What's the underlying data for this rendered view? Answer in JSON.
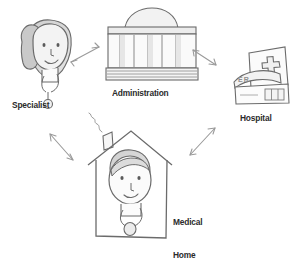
{
  "diagram": {
    "style": "hand-drawn pencil sketch",
    "background_color": "#ffffff",
    "ink_color": "#555555",
    "label_color": "#2b2b2b",
    "shade_color": "#d9d9d9",
    "nodes": [
      {
        "id": "specialist",
        "label": "Specialist",
        "icon": "doctor-with-stethoscope-icon",
        "description": "Person with long hair wearing a stethoscope",
        "position": "top-left"
      },
      {
        "id": "administration",
        "label": "Administration",
        "icon": "government-building-icon",
        "description": "Classical domed building with columns and steps",
        "position": "top-center"
      },
      {
        "id": "hospital",
        "label": "Hospital",
        "icon": "hospital-building-icon",
        "description": "Building with medical cross and ER sign",
        "sign_text": "ER",
        "position": "right"
      },
      {
        "id": "medical-home",
        "label_line1": "Medical",
        "label_line2": "Home",
        "label": "Medical Home",
        "icon": "house-with-doctor-icon",
        "description": "House with chimney, smoke, and a doctor figure inside",
        "position": "bottom-center"
      }
    ],
    "connectors": [
      {
        "id": "specialist-administration",
        "from": "specialist",
        "to": "administration",
        "arrowheads": "double"
      },
      {
        "id": "administration-hospital",
        "from": "administration",
        "to": "hospital",
        "arrowheads": "double"
      },
      {
        "id": "hospital-medical-home",
        "from": "hospital",
        "to": "medical-home",
        "arrowheads": "double"
      },
      {
        "id": "medical-home-specialist",
        "from": "medical-home",
        "to": "specialist",
        "arrowheads": "double"
      }
    ]
  }
}
